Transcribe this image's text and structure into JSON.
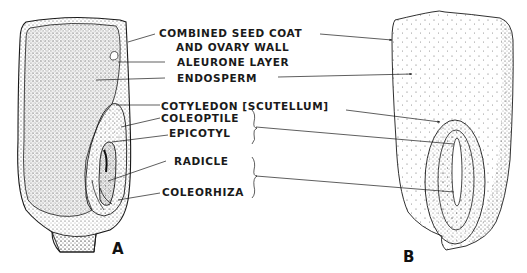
{
  "figure": {
    "panels": [
      {
        "id": "A",
        "label": "A",
        "description": "longitudinal section of seed"
      },
      {
        "id": "B",
        "label": "B",
        "description": "external view of seed"
      }
    ],
    "labels": {
      "seed_coat_line1": "COMBINED SEED COAT",
      "seed_coat_line2": "AND OVARY WALL",
      "aleurone": "ALEURONE LAYER",
      "endosperm": "ENDOSPERM",
      "cotyledon": "COTYLEDON [SCUTELLUM]",
      "coleoptile": "COLEOPTILE",
      "epicotyl": "EPICOTYL",
      "radicle": "RADICLE",
      "coleorhiza": "COLEORHIZA"
    },
    "colors": {
      "ink": "#1a1a1a",
      "stipple": "#555555",
      "background": "#ffffff"
    }
  }
}
